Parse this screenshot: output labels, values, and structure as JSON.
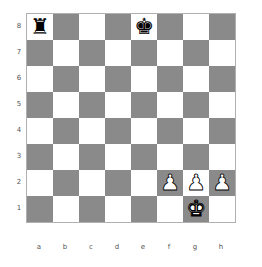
{
  "board": {
    "light_color": "#ffffff",
    "dark_color": "#8a8a8a",
    "files": [
      "a",
      "b",
      "c",
      "d",
      "e",
      "f",
      "g",
      "h"
    ],
    "ranks": [
      "8",
      "7",
      "6",
      "5",
      "4",
      "3",
      "2",
      "1"
    ],
    "pieces": [
      {
        "square": "a8",
        "color": "black",
        "type": "rook",
        "glyph": "♜"
      },
      {
        "square": "e8",
        "color": "black",
        "type": "king",
        "glyph": "♚"
      },
      {
        "square": "f2",
        "color": "white",
        "type": "pawn",
        "glyph": "♟"
      },
      {
        "square": "g2",
        "color": "white",
        "type": "pawn",
        "glyph": "♟"
      },
      {
        "square": "h2",
        "color": "white",
        "type": "pawn",
        "glyph": "♟"
      },
      {
        "square": "g1",
        "color": "white",
        "type": "king",
        "glyph": "♚"
      }
    ]
  }
}
